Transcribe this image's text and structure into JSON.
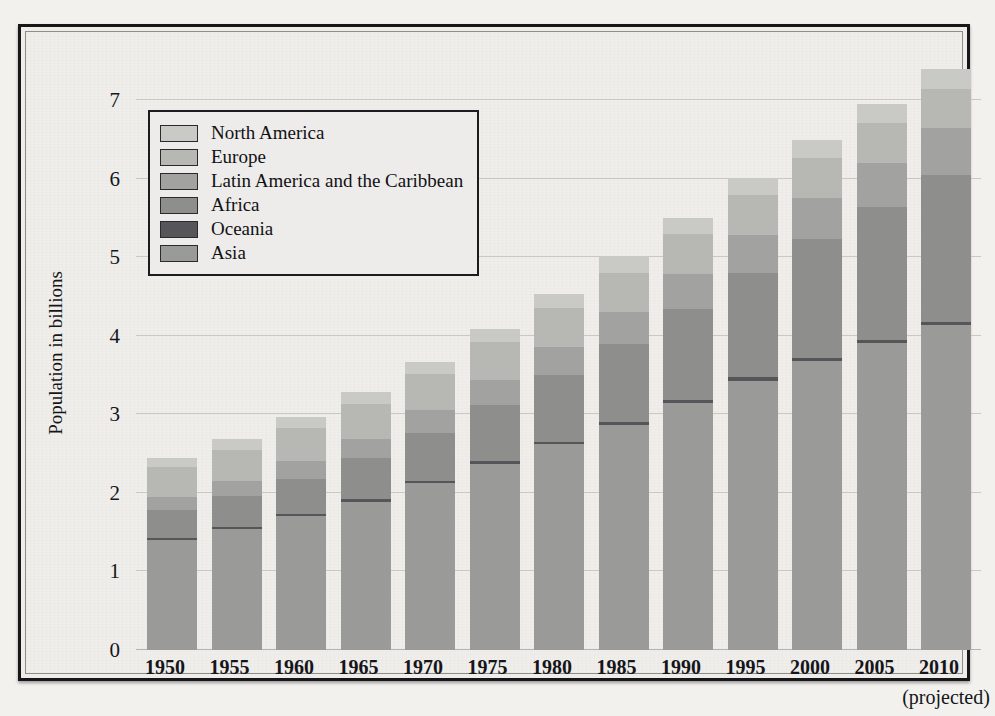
{
  "chart_data": {
    "type": "bar",
    "stacked": true,
    "title": "",
    "xlabel": "",
    "ylabel": "Population in billions",
    "ylim": [
      0,
      7
    ],
    "yticks": [
      0,
      1,
      2,
      3,
      4,
      5,
      6,
      7
    ],
    "grid": true,
    "legend_position": "upper-left",
    "x_note": "(projected)",
    "x_note_category": "2010",
    "categories": [
      "1950",
      "1955",
      "1960",
      "1965",
      "1970",
      "1975",
      "1980",
      "1985",
      "1990",
      "1995",
      "2000",
      "2005",
      "2010"
    ],
    "series": [
      {
        "name": "Asia",
        "color": "#9a9a98",
        "values": [
          1.4,
          1.54,
          1.7,
          1.89,
          2.12,
          2.37,
          2.62,
          2.87,
          3.15,
          3.43,
          3.68,
          3.91,
          4.14
        ]
      },
      {
        "name": "Oceania",
        "color": "#55555a",
        "values": [
          0.03,
          0.03,
          0.03,
          0.03,
          0.03,
          0.03,
          0.03,
          0.03,
          0.03,
          0.04,
          0.04,
          0.04,
          0.04
        ]
      },
      {
        "name": "Africa",
        "color": "#8e8e8c",
        "values": [
          0.35,
          0.39,
          0.45,
          0.52,
          0.61,
          0.72,
          0.85,
          1.0,
          1.16,
          1.33,
          1.51,
          1.69,
          1.87
        ]
      },
      {
        "name": "Latin America and the Caribbean",
        "color": "#a2a2a0",
        "values": [
          0.17,
          0.19,
          0.22,
          0.25,
          0.29,
          0.32,
          0.36,
          0.4,
          0.44,
          0.48,
          0.52,
          0.56,
          0.59
        ]
      },
      {
        "name": "Europe",
        "color": "#b7b7b4",
        "values": [
          0.38,
          0.4,
          0.42,
          0.44,
          0.46,
          0.48,
          0.49,
          0.5,
          0.51,
          0.51,
          0.51,
          0.51,
          0.5
        ]
      },
      {
        "name": "North America",
        "color": "#c9c9c6",
        "values": [
          0.12,
          0.13,
          0.14,
          0.15,
          0.16,
          0.17,
          0.18,
          0.2,
          0.21,
          0.22,
          0.23,
          0.24,
          0.25
        ]
      }
    ],
    "totals": [
      2.45,
      2.78,
      3.03,
      3.35,
      3.7,
      4.08,
      4.46,
      4.87,
      5.29,
      5.72,
      6.12,
      6.5,
      6.9
    ],
    "stack_order_bottom_to_top": [
      "Asia",
      "Oceania",
      "Africa",
      "Latin America and the Caribbean",
      "Europe",
      "North America"
    ]
  },
  "legend": {
    "items": [
      {
        "label": "North America",
        "swatch": "#c9c9c6"
      },
      {
        "label": "Europe",
        "swatch": "#b7b7b4"
      },
      {
        "label": "Latin America and the Caribbean",
        "swatch": "#a2a2a0"
      },
      {
        "label": "Africa",
        "swatch": "#8e8e8c"
      },
      {
        "label": "Oceania",
        "swatch": "#55555a"
      },
      {
        "label": "Asia",
        "swatch": "#9a9a98"
      }
    ]
  },
  "colors": {
    "page_background": "#f2f1ee",
    "figure_background": "#efeeeb",
    "frame": "#17171a",
    "gridline": "#c9c8c5",
    "text": "#16161a"
  }
}
